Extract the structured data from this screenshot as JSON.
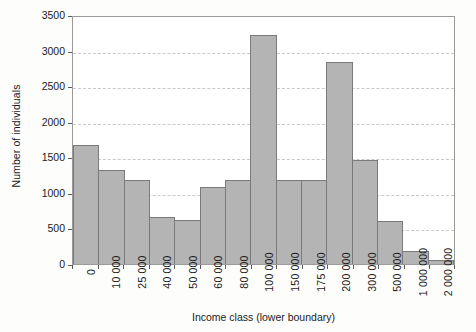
{
  "chart_data": {
    "type": "bar",
    "title": "",
    "subtitle": "",
    "xlabel": "Income class (lower boundary)",
    "ylabel": "Number of individuals",
    "categories": [
      "0",
      "10 000",
      "25 000",
      "40 000",
      "50 000",
      "60 000",
      "80 000",
      "100 000",
      "150 000",
      "175 000",
      "200 000",
      "300 000",
      "500 000",
      "1 000 000",
      "2 000 000"
    ],
    "values": [
      1670,
      1320,
      1175,
      660,
      620,
      1085,
      1180,
      3225,
      1175,
      1175,
      2845,
      1460,
      610,
      180,
      60
    ],
    "ylim": [
      0,
      3500
    ],
    "ytick_labels": [
      "0",
      "500",
      "1000",
      "1500",
      "2000",
      "2500",
      "3000",
      "3500"
    ],
    "ytick_values": [
      0,
      500,
      1000,
      1500,
      2000,
      2500,
      3000,
      3500
    ],
    "grid": "horizontal-dashed",
    "legend": "none",
    "bar_fill_color": "#b4b4b4",
    "bar_edge_color": "#7a7a7a",
    "grid_color": "#c9c9c9",
    "axis_color": "#9a9a9a",
    "plot_background": "#ffffff",
    "page_background": "#fdfdfb"
  }
}
